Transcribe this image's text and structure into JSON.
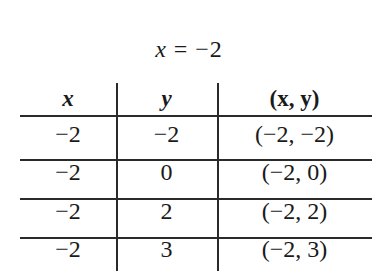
{
  "title": {
    "var": "x",
    "op": " = ",
    "value": "−2"
  },
  "table": {
    "headers": [
      "x",
      "y",
      "(x, y)"
    ],
    "rows": [
      {
        "x": "−2",
        "y": "−2",
        "pair": "(−2, −2)"
      },
      {
        "x": "−2",
        "y": "0",
        "pair": "(−2, 0)"
      },
      {
        "x": "−2",
        "y": "2",
        "pair": "(−2, 2)"
      },
      {
        "x": "−2",
        "y": "3",
        "pair": "(−2, 3)"
      }
    ]
  }
}
